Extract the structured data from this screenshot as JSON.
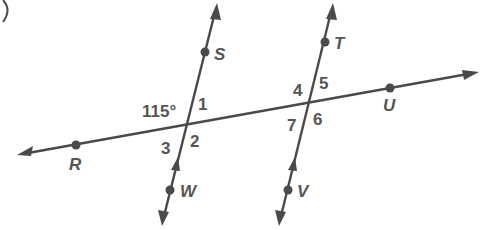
{
  "diagram": {
    "colors": {
      "line": "#4a4a4a",
      "text": "#555555",
      "background": "#ffffff"
    },
    "transversal": {
      "name": "line RU",
      "points": [
        {
          "label": "R",
          "x": 76,
          "y": 145
        },
        {
          "label": "U",
          "x": 390,
          "y": 88
        }
      ]
    },
    "parallel_lines": [
      {
        "name": "line SW",
        "points": [
          {
            "label": "S",
            "x": 205,
            "y": 52
          },
          {
            "label": "W",
            "x": 170,
            "y": 190
          }
        ],
        "parallel_mark": "single-arrow"
      },
      {
        "name": "line TV",
        "points": [
          {
            "label": "T",
            "x": 325,
            "y": 42
          },
          {
            "label": "V",
            "x": 288,
            "y": 190
          }
        ],
        "parallel_mark": "single-arrow"
      }
    ],
    "point_labels": {
      "S": "S",
      "T": "T",
      "U": "U",
      "R": "R",
      "W": "W",
      "V": "V"
    },
    "angles": {
      "given": "115°",
      "a1": "1",
      "a2": "2",
      "a3": "3",
      "a4": "4",
      "a5": "5",
      "a6": "6",
      "a7": "7"
    },
    "corner_mark": ")"
  }
}
